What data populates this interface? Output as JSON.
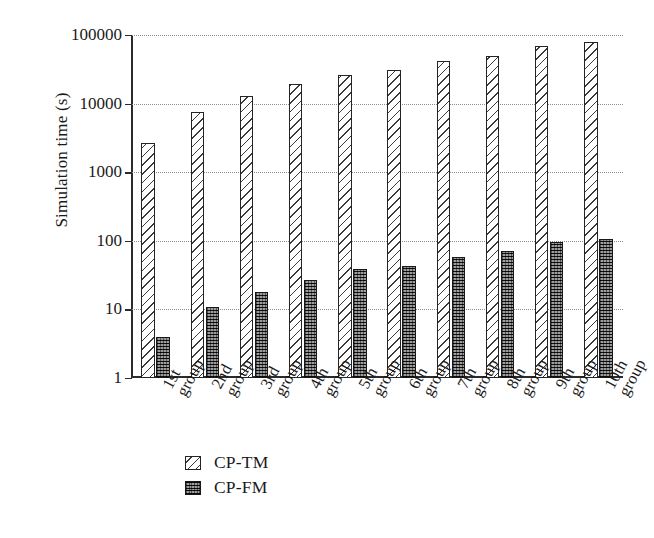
{
  "chart_data": {
    "type": "bar",
    "title": "",
    "xlabel": "",
    "ylabel": "Simulation time (s)",
    "yscale": "log",
    "ylim": [
      1,
      100000
    ],
    "ytick_labels": [
      "100000",
      "10000",
      "1000",
      "100",
      "10",
      "1"
    ],
    "ytick_values": [
      100000,
      10000,
      1000,
      100,
      10,
      1
    ],
    "grid": true,
    "grid_style": "dotted",
    "legend_position": "below-axes-left",
    "categories": [
      "1st group",
      "2nd group",
      "3rd group",
      "4th group",
      "5th group",
      "6th group",
      "7th group",
      "8th group",
      "9th group",
      "10th group"
    ],
    "category_lines": [
      [
        "1st",
        "group"
      ],
      [
        "2nd",
        "group"
      ],
      [
        "3rd",
        "group"
      ],
      [
        "4th",
        "group"
      ],
      [
        "5th",
        "group"
      ],
      [
        "6th",
        "group"
      ],
      [
        "7th",
        "group"
      ],
      [
        "8th",
        "group"
      ],
      [
        "9th",
        "group"
      ],
      [
        "10th",
        "group"
      ]
    ],
    "series": [
      {
        "name": "CP-TM",
        "pattern": "diagonal-hatch",
        "color": "#ffffff",
        "values": [
          2700,
          7600,
          13000,
          19000,
          26000,
          31000,
          42000,
          50000,
          69000,
          78000
        ]
      },
      {
        "name": "CP-FM",
        "pattern": "cross-hatch-dark",
        "color": "#4a4a4a",
        "values": [
          4.0,
          11,
          18,
          27,
          39,
          43,
          58,
          72,
          96,
          108
        ]
      }
    ]
  },
  "legend": {
    "items": [
      {
        "label": "CP-TM",
        "key": "tm"
      },
      {
        "label": "CP-FM",
        "key": "fm"
      }
    ]
  }
}
